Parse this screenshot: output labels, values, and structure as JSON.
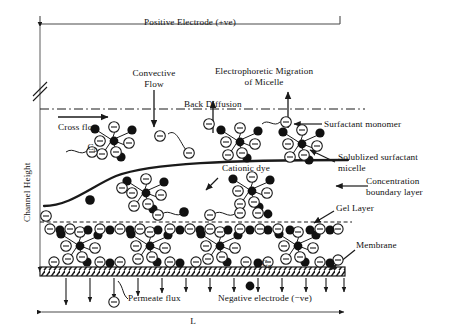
{
  "figure": {
    "type": "diagram",
    "background_color": "#ffffff",
    "line_color": "#1a1a1a",
    "fill_dye_color": "#111111",
    "head_fill_color": "#ffffff"
  },
  "labels": {
    "positive_electrode": "Positive Electrode (+ve)",
    "negative_electrode": "Negative electrode (−ve)",
    "convective_flow": "Convective\nFlow",
    "electrophoretic_migration": "Electrophoretic Migration\nof Micelle",
    "back_diffusion": "Back Diffusion",
    "cross_flow": "Cross flow",
    "surfactant_monomer": "Surfactant monomer",
    "solublized_micelle": "Solublized surfactant\nmicelle",
    "concentration_boundary_layer": "Concentration\nboundary layer",
    "cationic_dye": "Cationic dye",
    "gel_layer": "Gel Layer",
    "membrane": "Membrane",
    "permeate_flux": "Permeate flux",
    "channel_height": "Channel Height",
    "length": "L",
    "c_zero_main": "C",
    "c_zero_sub": "0",
    "c_gel_main": "C",
    "c_gel_sub": "g"
  },
  "elements": {
    "electrode_top_label": "Positive Electrode (+ve)",
    "electrode_bottom_label": "Negative electrode (−ve)",
    "axis_break_symbol": "double-slash-break",
    "membrane_pattern": "diagonal-hatch",
    "boundary_layer_line_style": "solid-thick-curve",
    "gel_layer_line_style": "dashed",
    "back_diffusion_line_style": "dash-dot"
  },
  "counts": {
    "permeate_arrows": 13,
    "bulk_micelles": 5,
    "gel_micelles": 4
  }
}
